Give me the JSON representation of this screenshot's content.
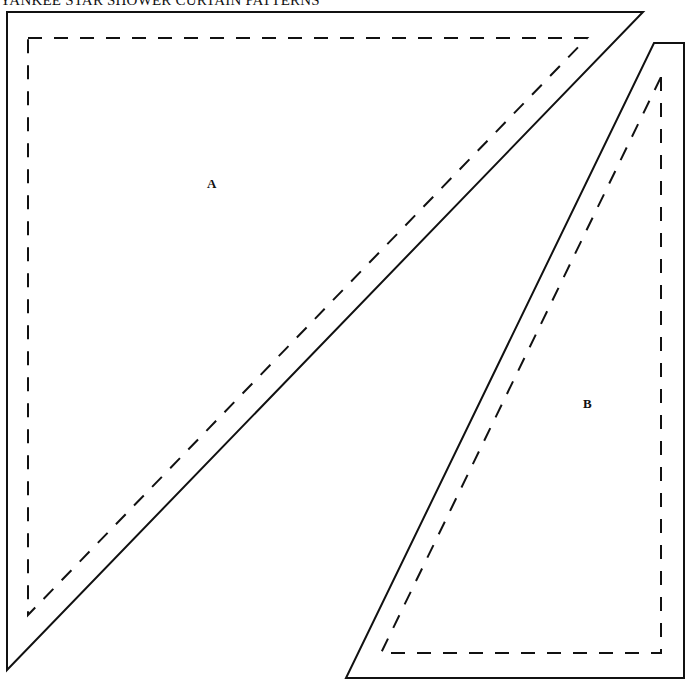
{
  "header": {
    "title": "YANKEE STAR SHOWER CURTAIN PATTERNS"
  },
  "pieces": [
    {
      "id": "A",
      "label": "A"
    },
    {
      "id": "B",
      "label": "B"
    }
  ],
  "colors": {
    "line": "#111111",
    "background": "#ffffff"
  }
}
